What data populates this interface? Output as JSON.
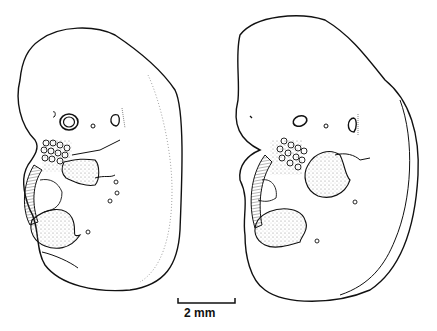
{
  "figure": {
    "panels": [
      {
        "id": "left",
        "description": "embryo drawing, lateral view (earlier stage)"
      },
      {
        "id": "right",
        "description": "embryo drawing, lateral view (later stage)"
      }
    ],
    "scale_bar": {
      "label": "2 mm"
    }
  },
  "colors": {
    "ink": "#111111",
    "background": "#ffffff",
    "stipple": "#777777"
  }
}
